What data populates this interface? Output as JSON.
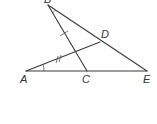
{
  "diagram": {
    "type": "geometry",
    "points": {
      "A": {
        "label": "A",
        "x": 26,
        "y": 71
      },
      "B": {
        "label": "B",
        "x": 48,
        "y": 5
      },
      "C": {
        "label": "C",
        "x": 87,
        "y": 71
      },
      "D": {
        "label": "D",
        "x": 100,
        "y": 42
      },
      "E": {
        "label": "E",
        "x": 147,
        "y": 71
      }
    },
    "segments": [
      {
        "from": "B",
        "to": "C"
      },
      {
        "from": "B",
        "to": "E"
      },
      {
        "from": "A",
        "to": "E"
      },
      {
        "from": "A",
        "to": "D"
      }
    ],
    "marks": {
      "single_tick": "BC",
      "double_tick": "AD",
      "angle_arcs": [
        "B",
        "A"
      ]
    },
    "colors": {
      "line": "#3a3a3a",
      "label": "#333333",
      "background": "#ffffff"
    }
  }
}
